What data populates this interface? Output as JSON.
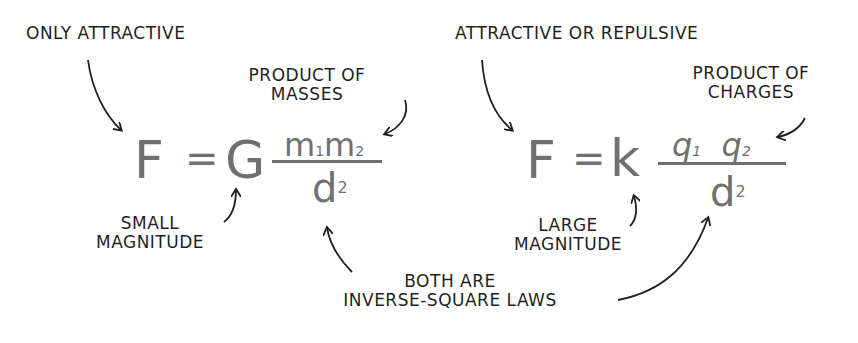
{
  "left_equation": {
    "annotation_top": "ONLY ATTRACTIVE",
    "annotation_numerator": [
      "PRODUCT OF",
      "MASSES"
    ],
    "annotation_constant": [
      "SMALL",
      "MAGNITUDE"
    ],
    "lhs": "F",
    "equals": "=",
    "constant": "G",
    "numerator_terms": [
      {
        "symbol": "m",
        "subscript": "1"
      },
      {
        "symbol": "m",
        "subscript": "2"
      }
    ],
    "denominator": {
      "symbol": "d",
      "superscript": "2"
    }
  },
  "right_equation": {
    "annotation_top": "ATTRACTIVE OR REPULSIVE",
    "annotation_numerator": [
      "PRODUCT OF",
      "CHARGES"
    ],
    "annotation_constant": [
      "LARGE",
      "MAGNITUDE"
    ],
    "lhs": "F",
    "equals": "=",
    "constant": "k",
    "numerator_terms": [
      {
        "symbol": "q",
        "subscript": "1"
      },
      {
        "symbol": "q",
        "subscript": "2"
      }
    ],
    "denominator": {
      "symbol": "d",
      "superscript": "2"
    }
  },
  "shared_annotation": [
    "BOTH ARE",
    "INVERSE-SQUARE LAWS"
  ],
  "colors": {
    "ink": "#1f1f1f",
    "equation": "#707070",
    "background": "#ffffff"
  }
}
